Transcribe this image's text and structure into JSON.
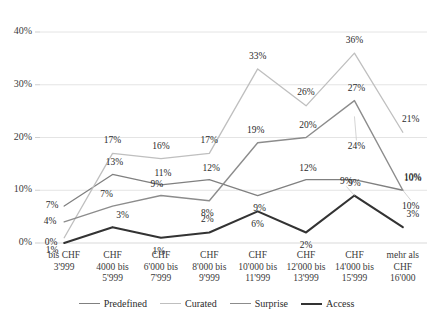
{
  "chart_data": {
    "type": "line",
    "title": "",
    "xlabel": "",
    "ylabel": "",
    "ylim": [
      0,
      40
    ],
    "ytick_labels": [
      "0%",
      "10%",
      "20%",
      "30%",
      "40%"
    ],
    "yticks": [
      0,
      10,
      20,
      30,
      40
    ],
    "grid": "horizontal",
    "legend_position": "bottom",
    "value_labels_suffix": "%",
    "categories": [
      "bis CHF 3'999",
      "CHF 4000 bis 5'999",
      "CHF 6'000 bis 7'999",
      "CHF 8'000 bis 9'999",
      "CHF 10'000 bis 11'999",
      "CHF 12'000 bis 13'999",
      "CHF 14'000 bis 15'999",
      "mehr als CHF 16'000"
    ],
    "category_lines": [
      [
        "bis CHF",
        "3'999"
      ],
      [
        "CHF",
        "4000 bis",
        "5'999"
      ],
      [
        "CHF",
        "6'000 bis",
        "7'999"
      ],
      [
        "CHF",
        "8'000 bis",
        "9'999"
      ],
      [
        "CHF",
        "10'000 bis",
        "11'999"
      ],
      [
        "CHF",
        "12'000 bis",
        "13'999"
      ],
      [
        "CHF",
        "14'000 bis",
        "15'999"
      ],
      [
        "mehr als",
        "CHF",
        "16'000"
      ]
    ],
    "series": [
      {
        "name": "Predefined",
        "color": "#808080",
        "width": 1.3,
        "values": [
          7,
          13,
          11,
          12,
          9,
          12,
          12,
          10
        ],
        "labels": [
          "7%",
          "13%",
          "11%",
          "12%",
          "9%",
          "12%",
          "",
          "10%"
        ]
      },
      {
        "name": "Curated",
        "color": "#bfbfbf",
        "width": 1.3,
        "values": [
          1,
          17,
          16,
          17,
          33,
          26,
          36,
          21
        ],
        "labels": [
          "1%",
          "17%",
          "16%",
          "17%",
          "33%",
          "26%",
          "36%",
          "21%"
        ]
      },
      {
        "name": "Surprise",
        "color": "#8c8c8c",
        "width": 1.4,
        "values": [
          4,
          7,
          9,
          8,
          19,
          20,
          27,
          10
        ],
        "labels": [
          "4%",
          "7%",
          "9%",
          "8%",
          "19%",
          "20%",
          "27%",
          "10%"
        ]
      },
      {
        "name": "Access",
        "color": "#333333",
        "width": 2.1,
        "values": [
          0,
          3,
          1,
          2,
          6,
          2,
          9,
          3
        ],
        "labels": [
          "0%",
          "3%",
          "1%",
          "2%",
          "6%",
          "2%",
          "9%",
          "3%"
        ]
      }
    ],
    "extra_labels": [
      {
        "text": "24%",
        "x": 7,
        "y": 24,
        "series": "Surprise",
        "note": "callout for Surprise peak"
      },
      {
        "text": "9%",
        "x": 7,
        "y": 9,
        "series": "Access",
        "note": "callout for Access peak"
      },
      {
        "text": "10%",
        "x": 8,
        "y": 10,
        "series": "Predefined",
        "note": "lower callout at final point"
      }
    ]
  },
  "legend": {
    "items": [
      {
        "label": "Predefined",
        "color": "#808080",
        "width": 1.3
      },
      {
        "label": "Curated",
        "color": "#bfbfbf",
        "width": 1.3
      },
      {
        "label": "Surprise",
        "color": "#8c8c8c",
        "width": 1.4
      },
      {
        "label": "Access",
        "color": "#333333",
        "width": 2.1
      }
    ]
  }
}
